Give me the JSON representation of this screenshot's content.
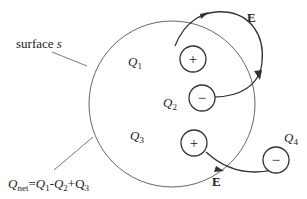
{
  "diagram": {
    "surface_label": "surface s",
    "net_charge_label": "Qnet=Q1-Q2+Q3",
    "field_label": "E",
    "charges": [
      {
        "name": "Q1",
        "base": "Q",
        "sub": "1",
        "sign": "+"
      },
      {
        "name": "Q2",
        "base": "Q",
        "sub": "2",
        "sign": "−"
      },
      {
        "name": "Q3",
        "base": "Q",
        "sub": "3",
        "sign": "+"
      },
      {
        "name": "Q4",
        "base": "Q",
        "sub": "4",
        "sign": "−"
      }
    ],
    "formula": {
      "q": "Q",
      "net_sub": "net",
      "eq": "=",
      "q1": "Q",
      "s1": "1",
      "minus": "-",
      "q2": "Q",
      "s2": "2",
      "plus": "+Q",
      "s3": "3"
    },
    "surface": {
      "word": "surface",
      "var": "s"
    },
    "colors": {
      "line": "#333333",
      "surface": "#666666",
      "background": "#ffffff"
    }
  }
}
